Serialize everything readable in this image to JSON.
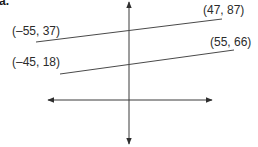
{
  "problem": {
    "part_label": "a."
  },
  "axes": {
    "color": "#3a3a3a",
    "x_axis": {
      "y": 100,
      "x1": 48,
      "x2": 212,
      "arrows": "both"
    },
    "y_axis": {
      "x": 129,
      "y1": 2,
      "y2": 144,
      "arrows": "both"
    }
  },
  "lines": [
    {
      "name": "upper-line",
      "color": "#4a4a4a",
      "start": {
        "label": "(–55, 37)",
        "x": -55,
        "y": 37,
        "px": 36,
        "py": 42
      },
      "end": {
        "label": "(47, 87)",
        "x": 47,
        "y": 87,
        "px": 222,
        "py": 19
      }
    },
    {
      "name": "lower-line",
      "color": "#4a4a4a",
      "start": {
        "label": "(–45, 18)",
        "x": -45,
        "y": 18,
        "px": 60,
        "py": 74
      },
      "end": {
        "label": "(55, 66)",
        "x": 55,
        "y": 66,
        "px": 234,
        "py": 50
      }
    }
  ]
}
